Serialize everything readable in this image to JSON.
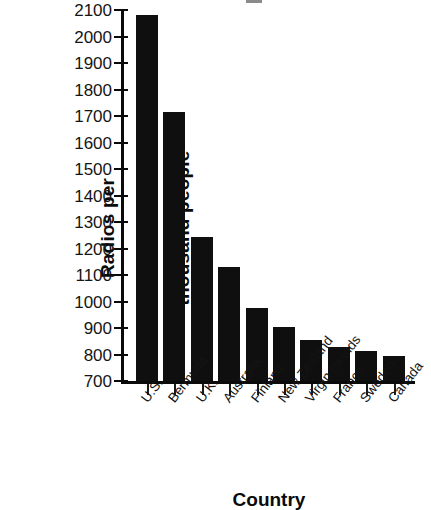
{
  "chart_data": {
    "type": "bar",
    "title": "",
    "xlabel": "Country",
    "ylabel": "Radios per thousand people",
    "ylabel_lines": [
      "Radios per",
      "thousand people"
    ],
    "categories": [
      "U.S.",
      "Bermuda",
      "U.K.",
      "Australia",
      "Finland",
      "New Zealand",
      "Virgin Islands",
      "France",
      "Sweden",
      "Canada"
    ],
    "values": [
      2080,
      1715,
      1245,
      1130,
      975,
      905,
      855,
      830,
      815,
      795
    ],
    "ylim": [
      700,
      2100
    ],
    "ytick_labels": [
      "2100",
      "2000",
      "1900",
      "1800",
      "1700",
      "1600",
      "1500",
      "1400",
      "1300",
      "1200",
      "1100",
      "1000",
      "900",
      "800",
      "700"
    ],
    "ytick_values": [
      2100,
      2000,
      1900,
      1800,
      1700,
      1600,
      1500,
      1400,
      1300,
      1200,
      1100,
      1000,
      900,
      800,
      700
    ],
    "grid": false,
    "legend": null,
    "bar_color": "#100f0f",
    "axis_color": "#0a0a0a",
    "background_color": "#ffffff"
  }
}
